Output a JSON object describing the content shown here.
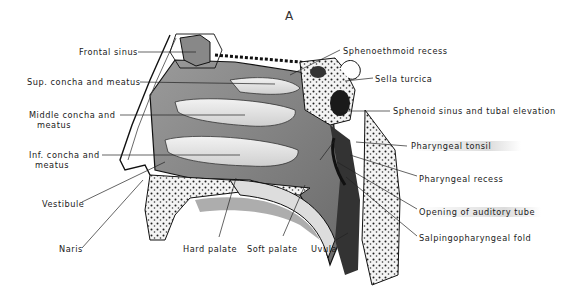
{
  "figure": {
    "title": "A",
    "labels_left": [
      {
        "id": "frontal-sinus",
        "text": "Frontal sinus"
      },
      {
        "id": "sup-concha",
        "text": "Sup. concha and meatus"
      },
      {
        "id": "middle-concha-1",
        "text": "Middle concha and"
      },
      {
        "id": "middle-concha-2",
        "text": "meatus"
      },
      {
        "id": "inf-concha-1",
        "text": "Inf. concha and"
      },
      {
        "id": "inf-concha-2",
        "text": "meatus"
      },
      {
        "id": "vestibule",
        "text": "Vestibule"
      },
      {
        "id": "naris",
        "text": "Naris"
      }
    ],
    "labels_bottom": [
      {
        "id": "hard-palate",
        "text": "Hard palate"
      },
      {
        "id": "soft-palate",
        "text": "Soft palate"
      },
      {
        "id": "uvula",
        "text": "Uvula"
      }
    ],
    "labels_right": [
      {
        "id": "sphenoethmoid-recess",
        "text": "Sphenoethmoid recess"
      },
      {
        "id": "sella-turcica",
        "text": "Sella turcica"
      },
      {
        "id": "sphenoid-sinus",
        "text": "Sphenoid sinus and tubal elevation"
      },
      {
        "id": "pharyngeal-tonsil",
        "text": "Pharyngeal tonsil"
      },
      {
        "id": "pharyngeal-recess",
        "text": "Pharyngeal recess"
      },
      {
        "id": "opening-auditory-tube",
        "text": "Opening of auditory tube"
      },
      {
        "id": "salpingopharyngeal-fold",
        "text": "Salpingopharyngeal fold"
      }
    ]
  }
}
